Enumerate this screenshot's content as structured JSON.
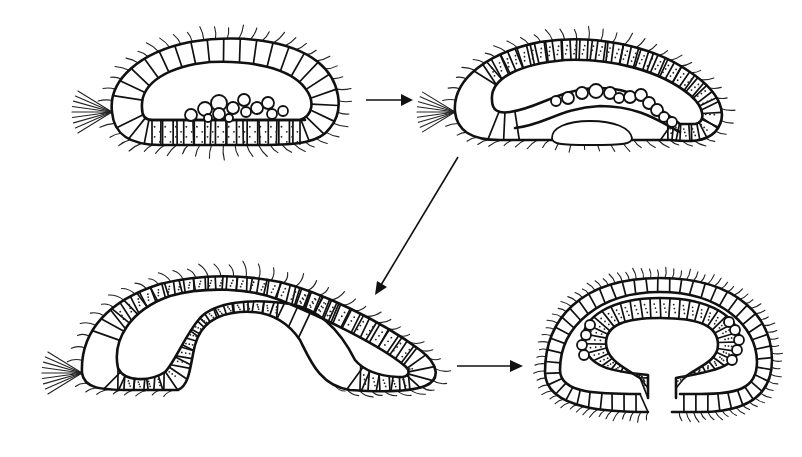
{
  "diagram": {
    "type": "developmental sequence",
    "background": "#ffffff",
    "stroke_color": "#111111",
    "labels_visible": false,
    "stages": [
      {
        "id": 1,
        "name": "stage-1-hollow-ciliated-larva",
        "features": [
          "outer ciliated epithelium",
          "apical tuft of long cilia (left)",
          "blastocoel cavity",
          "flattened dotted ventral cell plate",
          "cluster of round cells on ventral plate"
        ]
      },
      {
        "id": 2,
        "name": "stage-2-plate-thickening",
        "features": [
          "outer ciliated epithelium",
          "apical tuft (left)",
          "arched dotted ventral cell plate",
          "row of round cells above plate",
          "detached mass below plate"
        ]
      },
      {
        "id": 3,
        "name": "stage-3-invagination",
        "features": [
          "elongated curved larva",
          "apical tuft (left)",
          "deeply invaginated dotted cell layer",
          "ciliated invagination lining"
        ]
      },
      {
        "id": 4,
        "name": "stage-4-curled-embryo",
        "features": [
          "rounded double-walled embryo",
          "inner dotted layer curled into horseshoe",
          "round cells along inner layer",
          "open ventral gap"
        ]
      }
    ],
    "arrows": [
      {
        "from": 1,
        "to": 2,
        "direction": "right"
      },
      {
        "from": 2,
        "to": 3,
        "direction": "down-left"
      },
      {
        "from": 3,
        "to": 4,
        "direction": "right"
      }
    ]
  }
}
